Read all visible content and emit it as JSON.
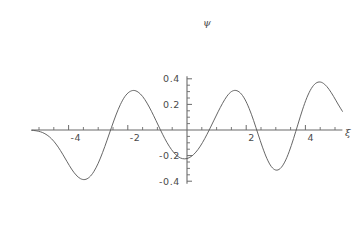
{
  "chart_data": {
    "type": "line",
    "title": "",
    "subtitle": "",
    "xlabel": "ξ",
    "ylabel": "ψ",
    "xlim": [
      -5.25,
      5.25
    ],
    "ylim": [
      -0.42,
      0.42
    ],
    "grid": false,
    "legend": null,
    "x_tick_labels": [
      "-4",
      "-2",
      "2",
      "4"
    ],
    "x_tick_values": [
      -4,
      -2,
      2,
      4
    ],
    "x_minor_ticks": [
      -5,
      -4.5,
      -3.5,
      -3,
      -2.5,
      -1.5,
      -1,
      -0.5,
      0.5,
      1,
      1.5,
      2.5,
      3,
      3.5,
      4.5,
      5
    ],
    "y_tick_labels": [
      "0.4",
      "0.2",
      "-0.2",
      "-0.4"
    ],
    "y_tick_values": [
      0.4,
      0.2,
      -0.2,
      -0.4
    ],
    "y_minor_ticks": [
      0.35,
      0.3,
      0.25,
      0.15,
      0.1,
      0.05,
      -0.05,
      -0.1,
      -0.15,
      -0.25,
      -0.3,
      -0.35
    ],
    "series": [
      {
        "name": "psi",
        "color": "#555555",
        "x": [
          -5.25,
          -5.1,
          -4.95,
          -4.8,
          -4.65,
          -4.5,
          -4.35,
          -4.2,
          -4.05,
          -3.9,
          -3.75,
          -3.6,
          -3.45,
          -3.3,
          -3.15,
          -3.0,
          -2.85,
          -2.7,
          -2.55,
          -2.4,
          -2.25,
          -2.1,
          -1.95,
          -1.8,
          -1.65,
          -1.5,
          -1.35,
          -1.2,
          -1.05,
          -0.9,
          -0.75,
          -0.6,
          -0.45,
          -0.3,
          -0.15,
          0.0,
          0.15,
          0.3,
          0.45,
          0.6,
          0.75,
          0.9,
          1.05,
          1.2,
          1.35,
          1.5,
          1.65,
          1.8,
          1.95,
          2.1,
          2.25,
          2.4,
          2.55,
          2.7,
          2.85,
          3.0,
          3.15,
          3.3,
          3.45,
          3.6,
          3.75,
          3.9,
          4.05,
          4.2,
          4.35,
          4.5,
          4.65,
          4.8,
          4.95,
          5.1,
          5.25
        ],
        "y": [
          -0.002,
          -0.006,
          -0.014,
          -0.029,
          -0.053,
          -0.088,
          -0.134,
          -0.189,
          -0.248,
          -0.305,
          -0.351,
          -0.38,
          -0.387,
          -0.369,
          -0.326,
          -0.26,
          -0.175,
          -0.079,
          0.021,
          0.117,
          0.199,
          0.261,
          0.297,
          0.309,
          0.296,
          0.262,
          0.21,
          0.146,
          0.075,
          0.002,
          -0.067,
          -0.127,
          -0.175,
          -0.208,
          -0.224,
          -0.223,
          -0.206,
          -0.173,
          -0.126,
          -0.067,
          0.0,
          0.071,
          0.142,
          0.208,
          0.264,
          0.3,
          0.309,
          0.29,
          0.242,
          0.168,
          0.074,
          -0.031,
          -0.134,
          -0.223,
          -0.286,
          -0.313,
          -0.301,
          -0.251,
          -0.17,
          -0.067,
          0.046,
          0.157,
          0.253,
          0.324,
          0.365,
          0.375,
          0.357,
          0.317,
          0.263,
          0.203,
          0.146
        ]
      }
    ],
    "annotations": {
      "peaks": [
        {
          "x": -1.75,
          "y": 0.31
        },
        {
          "x": 0.55,
          "y": 0.31
        },
        {
          "x": 2.8,
          "y": 0.39
        }
      ],
      "troughs": [
        {
          "x": -2.85,
          "y": -0.39
        },
        {
          "x": -0.7,
          "y": -0.3
        },
        {
          "x": 1.4,
          "y": -0.31
        }
      ]
    }
  },
  "colors": {
    "curve": "#555555",
    "axis": "#6b6b6b",
    "text": "#4a4a4a",
    "background": "#ffffff"
  }
}
